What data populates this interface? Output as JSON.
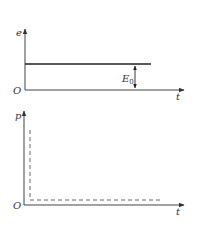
{
  "colors": {
    "axis": "#444444",
    "line": "#222222",
    "dashed": "#555555",
    "text": "#333333",
    "background": "#ffffff"
  },
  "top_chart": {
    "y_label": "e",
    "x_label": "t",
    "origin_label": "O",
    "level_label_main": "E",
    "level_label_sub": "0",
    "series": {
      "type": "constant",
      "style": "solid",
      "description": "constant emf E0"
    }
  },
  "bottom_chart": {
    "y_label": "p",
    "x_label": "t",
    "origin_label": "O",
    "series": {
      "type": "impulse-then-zero",
      "style": "dashed",
      "description": "power spike at t=0 then near zero"
    }
  }
}
